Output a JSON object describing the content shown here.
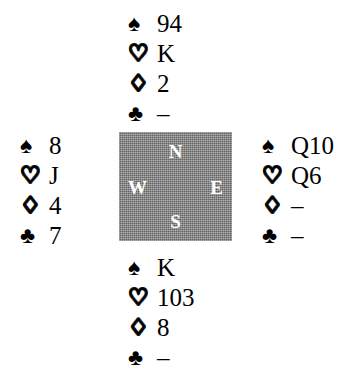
{
  "diagram": {
    "type": "bridge-hand-diagram",
    "suit_order": [
      "spades",
      "hearts",
      "diamonds",
      "clubs"
    ],
    "suit_symbols": {
      "spades": "♠",
      "hearts": "♡",
      "diamonds": "♢",
      "clubs": "♣"
    },
    "void_marker": "–",
    "colors": {
      "background": "#ffffff",
      "ink": "#000000",
      "compass_fill": "#8a8a8a",
      "compass_text": "#ffffff"
    }
  },
  "compass": {
    "north_label": "N",
    "west_label": "W",
    "east_label": "E",
    "south_label": "S"
  },
  "hands": {
    "north": {
      "position": "North",
      "spades": "94",
      "hearts": "K",
      "diamonds": "2",
      "clubs": "–"
    },
    "west": {
      "position": "West",
      "spades": "8",
      "hearts": "J",
      "diamonds": "4",
      "clubs": "7"
    },
    "east": {
      "position": "East",
      "spades": "Q10",
      "hearts": "Q6",
      "diamonds": "–",
      "clubs": "–"
    },
    "south": {
      "position": "South",
      "spades": "K",
      "hearts": "103",
      "diamonds": "8",
      "clubs": "–"
    }
  }
}
